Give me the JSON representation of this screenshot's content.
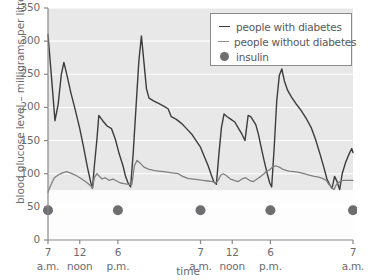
{
  "chart_data": {
    "type": "line",
    "title": "",
    "xlabel": "time",
    "ylabel": "blood glucose level – milligrams per litre",
    "ylim": [
      0,
      350
    ],
    "yticks": [
      0,
      50,
      100,
      150,
      200,
      250,
      300,
      350
    ],
    "ytick_labels": [
      "0",
      "50",
      "100",
      "150",
      "200",
      "250",
      "300",
      "350"
    ],
    "grid": true,
    "legend_position": "top-right",
    "xtick_positions": [
      0,
      5,
      11,
      24,
      29,
      35,
      48
    ],
    "xtick_labels": [
      "7",
      "12",
      "6",
      "7",
      "12",
      "6",
      "7"
    ],
    "xtick_sublabels": [
      "a.m.",
      "noon",
      "p.m.",
      "a.m.",
      "noon",
      "p.m.",
      "a.m."
    ],
    "xlim": [
      0,
      48
    ],
    "shaded_band": {
      "from": 75,
      "to": 350,
      "color": "#e8e8e8"
    },
    "series": [
      {
        "name": "people with diabetes",
        "color": "#3c3c3e",
        "width": 1.4,
        "points": [
          [
            0.0,
            310
          ],
          [
            0.6,
            240
          ],
          [
            1.1,
            180
          ],
          [
            1.6,
            205
          ],
          [
            2.1,
            250
          ],
          [
            2.5,
            268
          ],
          [
            3.0,
            248
          ],
          [
            3.6,
            222
          ],
          [
            4.3,
            196
          ],
          [
            5.0,
            168
          ],
          [
            5.6,
            140
          ],
          [
            6.2,
            110
          ],
          [
            6.7,
            88
          ],
          [
            7.0,
            78
          ],
          [
            7.3,
            112
          ],
          [
            7.7,
            152
          ],
          [
            8.0,
            188
          ],
          [
            8.6,
            180
          ],
          [
            9.3,
            172
          ],
          [
            10.0,
            168
          ],
          [
            10.6,
            152
          ],
          [
            11.2,
            130
          ],
          [
            11.8,
            112
          ],
          [
            12.2,
            96
          ],
          [
            12.6,
            86
          ],
          [
            13.0,
            80
          ],
          [
            13.4,
            130
          ],
          [
            13.9,
            208
          ],
          [
            14.3,
            270
          ],
          [
            14.7,
            308
          ],
          [
            15.1,
            268
          ],
          [
            15.5,
            228
          ],
          [
            15.9,
            214
          ],
          [
            16.6,
            210
          ],
          [
            17.4,
            206
          ],
          [
            18.2,
            202
          ],
          [
            18.9,
            198
          ],
          [
            19.4,
            186
          ],
          [
            20.2,
            182
          ],
          [
            21.0,
            176
          ],
          [
            21.8,
            168
          ],
          [
            22.6,
            160
          ],
          [
            23.3,
            150
          ],
          [
            24.0,
            140
          ],
          [
            24.6,
            126
          ],
          [
            25.2,
            112
          ],
          [
            25.7,
            98
          ],
          [
            26.1,
            88
          ],
          [
            26.5,
            84
          ],
          [
            26.9,
            130
          ],
          [
            27.3,
            170
          ],
          [
            27.7,
            190
          ],
          [
            28.2,
            186
          ],
          [
            28.8,
            182
          ],
          [
            29.4,
            178
          ],
          [
            30.0,
            168
          ],
          [
            30.5,
            160
          ],
          [
            31.0,
            150
          ],
          [
            31.5,
            188
          ],
          [
            31.9,
            186
          ],
          [
            32.3,
            180
          ],
          [
            32.7,
            174
          ],
          [
            33.1,
            160
          ],
          [
            33.5,
            142
          ],
          [
            34.0,
            120
          ],
          [
            34.5,
            100
          ],
          [
            34.9,
            86
          ],
          [
            35.2,
            80
          ],
          [
            35.6,
            140
          ],
          [
            36.0,
            210
          ],
          [
            36.4,
            248
          ],
          [
            36.8,
            258
          ],
          [
            37.2,
            240
          ],
          [
            37.7,
            226
          ],
          [
            38.3,
            216
          ],
          [
            39.0,
            206
          ],
          [
            39.8,
            196
          ],
          [
            40.6,
            184
          ],
          [
            41.4,
            170
          ],
          [
            42.1,
            152
          ],
          [
            42.8,
            130
          ],
          [
            43.4,
            110
          ],
          [
            43.9,
            92
          ],
          [
            44.3,
            84
          ],
          [
            44.7,
            78
          ],
          [
            45.1,
            96
          ],
          [
            45.5,
            88
          ],
          [
            45.9,
            76
          ],
          [
            46.3,
            100
          ],
          [
            46.8,
            116
          ],
          [
            47.3,
            128
          ],
          [
            47.8,
            138
          ],
          [
            48.0,
            132
          ]
        ]
      },
      {
        "name": "people without diabetes",
        "color": "#808082",
        "width": 1.3,
        "points": [
          [
            0.0,
            72
          ],
          [
            0.5,
            84
          ],
          [
            1.0,
            94
          ],
          [
            1.6,
            98
          ],
          [
            2.2,
            101
          ],
          [
            2.9,
            103
          ],
          [
            3.6,
            101
          ],
          [
            4.3,
            98
          ],
          [
            5.0,
            94
          ],
          [
            5.6,
            90
          ],
          [
            6.2,
            86
          ],
          [
            6.7,
            82
          ],
          [
            7.0,
            78
          ],
          [
            7.3,
            94
          ],
          [
            7.7,
            100
          ],
          [
            8.0,
            97
          ],
          [
            8.5,
            92
          ],
          [
            9.0,
            94
          ],
          [
            9.6,
            90
          ],
          [
            10.2,
            92
          ],
          [
            10.8,
            89
          ],
          [
            11.4,
            86
          ],
          [
            12.0,
            85
          ],
          [
            12.7,
            84
          ],
          [
            13.2,
            84
          ],
          [
            13.6,
            112
          ],
          [
            14.0,
            120
          ],
          [
            14.5,
            116
          ],
          [
            15.1,
            110
          ],
          [
            15.8,
            107
          ],
          [
            16.6,
            105
          ],
          [
            17.4,
            104
          ],
          [
            18.2,
            103
          ],
          [
            19.0,
            102
          ],
          [
            19.8,
            101
          ],
          [
            20.5,
            100
          ],
          [
            21.2,
            96
          ],
          [
            22.0,
            93
          ],
          [
            22.8,
            92
          ],
          [
            23.6,
            91
          ],
          [
            24.4,
            90
          ],
          [
            25.2,
            89
          ],
          [
            25.9,
            88
          ],
          [
            26.4,
            86
          ],
          [
            26.8,
            90
          ],
          [
            27.2,
            98
          ],
          [
            27.6,
            100
          ],
          [
            28.1,
            97
          ],
          [
            28.7,
            92
          ],
          [
            29.3,
            90
          ],
          [
            29.9,
            88
          ],
          [
            30.5,
            92
          ],
          [
            31.1,
            94
          ],
          [
            31.7,
            90
          ],
          [
            32.3,
            88
          ],
          [
            32.9,
            92
          ],
          [
            33.5,
            96
          ],
          [
            34.0,
            100
          ],
          [
            34.4,
            104
          ],
          [
            34.9,
            106
          ],
          [
            35.3,
            110
          ],
          [
            35.8,
            112
          ],
          [
            36.4,
            110
          ],
          [
            37.1,
            106
          ],
          [
            37.9,
            104
          ],
          [
            38.7,
            103
          ],
          [
            39.5,
            102
          ],
          [
            40.3,
            100
          ],
          [
            41.1,
            98
          ],
          [
            41.9,
            96
          ],
          [
            42.6,
            95
          ],
          [
            43.2,
            93
          ],
          [
            43.8,
            90
          ],
          [
            44.2,
            84
          ],
          [
            44.6,
            80
          ],
          [
            45.0,
            76
          ],
          [
            45.4,
            84
          ],
          [
            45.9,
            88
          ],
          [
            46.5,
            90
          ],
          [
            47.2,
            90
          ],
          [
            48.0,
            90
          ]
        ]
      }
    ],
    "insulin": {
      "name": "insulin",
      "color": "#6e6e70",
      "radius": 5,
      "y_value": 45,
      "x_values": [
        0,
        11,
        24,
        35,
        48
      ]
    },
    "legend": [
      {
        "label": "people with diabetes",
        "marker": "line",
        "color": "#3c3c3e"
      },
      {
        "label": "people without diabetes",
        "marker": "line",
        "color": "#808082"
      },
      {
        "label": "insulin",
        "marker": "dot",
        "color": "#6e6e70"
      }
    ]
  }
}
